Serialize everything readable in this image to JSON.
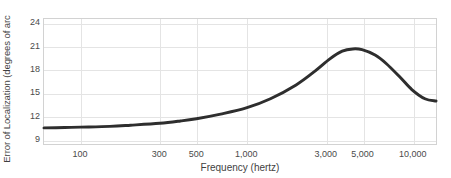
{
  "chart_data": {
    "type": "line",
    "title": "",
    "xlabel": "Frequency (hertz)",
    "ylabel": "Error of Localization (degrees of arc",
    "x_scale": "log",
    "xlim": [
      60,
      14000
    ],
    "ylim": [
      8.3,
      24.6
    ],
    "grid": true,
    "legend": null,
    "xticks": [
      {
        "value": 100,
        "label": "100"
      },
      {
        "value": 300,
        "label": "300"
      },
      {
        "value": 500,
        "label": "500"
      },
      {
        "value": 1000,
        "label": "1,000"
      },
      {
        "value": 3000,
        "label": "3,000"
      },
      {
        "value": 5000,
        "label": "5,000"
      },
      {
        "value": 10000,
        "label": "10,000"
      }
    ],
    "yticks": [
      {
        "value": 9,
        "label": "9"
      },
      {
        "value": 12,
        "label": "12"
      },
      {
        "value": 15,
        "label": "15"
      },
      {
        "value": 18,
        "label": "18"
      },
      {
        "value": 21,
        "label": "21"
      },
      {
        "value": 24,
        "label": "24"
      }
    ],
    "series": [
      {
        "name": "Error of localization",
        "color": "#2e2e2e",
        "line_width": 3,
        "x": [
          60,
          80,
          100,
          150,
          200,
          300,
          400,
          500,
          700,
          1000,
          1400,
          2000,
          2600,
          3200,
          3800,
          4400,
          5000,
          6000,
          7000,
          8500,
          10000,
          12000,
          14000
        ],
        "y": [
          10.4,
          10.45,
          10.5,
          10.6,
          10.75,
          11.0,
          11.3,
          11.6,
          12.2,
          13.0,
          14.2,
          16.0,
          17.8,
          19.4,
          20.4,
          20.7,
          20.6,
          19.9,
          18.8,
          17.0,
          15.4,
          14.2,
          13.9
        ]
      }
    ]
  },
  "figure": {
    "background_color": "#ffffff",
    "plot_border_color": "#d2d2d2",
    "gridline_color": "#e4e4e4",
    "tick_text_color": "#4a4a4a"
  }
}
